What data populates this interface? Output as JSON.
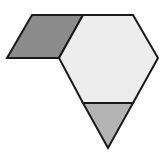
{
  "diagram": {
    "type": "pattern-blocks",
    "stroke_color": "#1a1a1a",
    "stroke_width": 2,
    "shapes": [
      {
        "name": "rhombus",
        "fill": "#8c8c8c",
        "points": "32,15 83,15 59,58 7,58"
      },
      {
        "name": "hexagon",
        "fill": "#ededed",
        "points": "83,15 133,15 158,58 133,103 83,103 59,58"
      },
      {
        "name": "triangle",
        "fill": "#b4b4b4",
        "points": "83,103 133,103 108,148"
      }
    ]
  }
}
